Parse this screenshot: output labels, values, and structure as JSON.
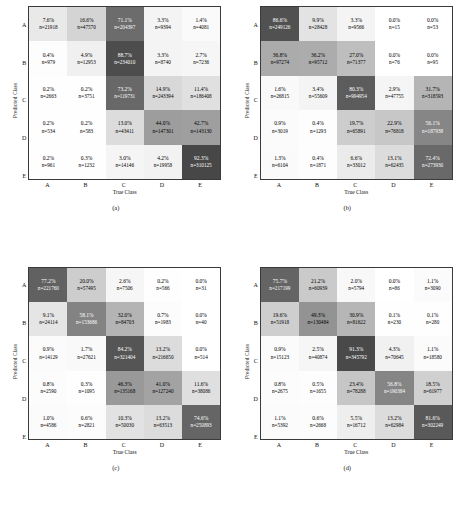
{
  "figure": {
    "axis_x_label": "True Class",
    "axis_y_label": "Predicted Class",
    "class_labels": [
      "A",
      "B",
      "C",
      "D",
      "E"
    ],
    "count_prefix": "n=",
    "colormap_low": "#ffffff",
    "colormap_high": "#3b3b3b"
  },
  "chart_data": [
    {
      "type": "heatmap",
      "title": "(a)",
      "xlabel": "True Class",
      "ylabel": "Predicted Class",
      "categories": [
        "A",
        "B",
        "C",
        "D",
        "E"
      ],
      "rows": [
        "A",
        "B",
        "C",
        "D",
        "E"
      ],
      "percent": [
        [
          7.6,
          16.6,
          71.1,
          3.3,
          1.4
        ],
        [
          0.4,
          4.9,
          88.7,
          3.3,
          2.7
        ],
        [
          0.2,
          0.2,
          73.2,
          14.9,
          11.4
        ],
        [
          0.2,
          0.2,
          13.0,
          44.0,
          42.7
        ],
        [
          0.2,
          0.3,
          3.0,
          4.2,
          92.3
        ]
      ],
      "counts": [
        [
          21918,
          47570,
          204397,
          9394,
          4081
        ],
        [
          979,
          12953,
          234010,
          8740,
          7236
        ],
        [
          2663,
          3751,
          119731,
          243394,
          186408
        ],
        [
          534,
          583,
          43411,
          147301,
          143130
        ],
        [
          961,
          1232,
          14146,
          19958,
          310125
        ]
      ]
    },
    {
      "type": "heatmap",
      "title": "(b)",
      "xlabel": "True Class",
      "ylabel": "Predicted Class",
      "categories": [
        "A",
        "B",
        "C",
        "D",
        "E"
      ],
      "rows": [
        "A",
        "B",
        "C",
        "D",
        "E"
      ],
      "percent": [
        [
          86.6,
          9.9,
          3.3,
          0.0,
          0.0
        ],
        [
          36.8,
          36.2,
          27.0,
          0.0,
          0.0
        ],
        [
          1.6,
          3.4,
          80.3,
          2.9,
          31.7
        ],
        [
          0.9,
          0.4,
          19.7,
          22.9,
          56.1
        ],
        [
          1.3,
          0.4,
          6.6,
          13.1,
          72.4
        ]
      ],
      "counts": [
        [
          249126,
          28428,
          9566,
          15,
          53
        ],
        [
          97274,
          95712,
          71377,
          76,
          95
        ],
        [
          26815,
          55609,
          994954,
          47755,
          318593
        ],
        [
          3019,
          1293,
          65891,
          76818,
          187938
        ],
        [
          6104,
          1871,
          33012,
          62435,
          273930
        ]
      ]
    },
    {
      "type": "heatmap",
      "title": "(c)",
      "xlabel": "True Class",
      "ylabel": "Predicted Class",
      "categories": [
        "A",
        "B",
        "C",
        "D",
        "E"
      ],
      "rows": [
        "A",
        "B",
        "C",
        "D",
        "E"
      ],
      "percent": [
        [
          77.2,
          20.0,
          2.6,
          0.2,
          0.0
        ],
        [
          9.1,
          58.1,
          32.0,
          0.7,
          0.0
        ],
        [
          0.9,
          1.7,
          84.2,
          13.2,
          0.0
        ],
        [
          0.8,
          0.3,
          46.3,
          41.0,
          11.6
        ],
        [
          1.0,
          0.6,
          10.3,
          13.2,
          74.6
        ]
      ],
      "counts": [
        [
          221760,
          57495,
          7506,
          566,
          31
        ],
        [
          24114,
          153686,
          84703,
          1983,
          40
        ],
        [
          14129,
          27621,
          321404,
          216650,
          514
        ],
        [
          2590,
          1095,
          135168,
          127240,
          38086
        ],
        [
          4586,
          2821,
          50030,
          63513,
          250893
        ]
      ]
    },
    {
      "type": "heatmap",
      "title": "(d)",
      "xlabel": "True Class",
      "ylabel": "Predicted Class",
      "categories": [
        "A",
        "B",
        "C",
        "D",
        "E"
      ],
      "rows": [
        "A",
        "B",
        "C",
        "D",
        "E"
      ],
      "percent": [
        [
          75.7,
          21.2,
          2.0,
          0.0,
          1.1
        ],
        [
          19.6,
          49.3,
          30.9,
          0.1,
          0.1
        ],
        [
          0.9,
          2.5,
          91.3,
          4.3,
          1.1
        ],
        [
          0.8,
          0.5,
          23.4,
          56.8,
          18.5
        ],
        [
          1.1,
          0.6,
          5.5,
          13.2,
          81.6
        ]
      ],
      "counts": [
        [
          217199,
          60939,
          5794,
          86,
          3090
        ],
        [
          51918,
          130484,
          81622,
          230,
          280
        ],
        [
          15123,
          40874,
          345792,
          70645,
          18580
        ],
        [
          2675,
          1655,
          78288,
          190384,
          61977
        ],
        [
          5392,
          2668,
          16712,
          62984,
          302249
        ]
      ]
    }
  ]
}
